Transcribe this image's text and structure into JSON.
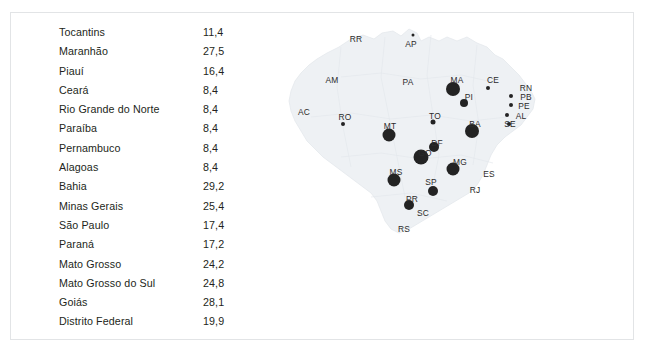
{
  "table": {
    "rows": [
      {
        "label": "Tocantins",
        "value": "11,4"
      },
      {
        "label": "Maranhão",
        "value": "27,5"
      },
      {
        "label": "Piauí",
        "value": "16,4"
      },
      {
        "label": "Ceará",
        "value": "8,4"
      },
      {
        "label": "Rio Grande do Norte",
        "value": "8,4"
      },
      {
        "label": "Paraíba",
        "value": "8,4"
      },
      {
        "label": "Pernambuco",
        "value": "8,4"
      },
      {
        "label": "Alagoas",
        "value": "8,4"
      },
      {
        "label": "Bahia",
        "value": "29,2"
      },
      {
        "label": "Minas Gerais",
        "value": "25,4"
      },
      {
        "label": "São Paulo",
        "value": "17,4"
      },
      {
        "label": "Paraná",
        "value": "17,2"
      },
      {
        "label": "Mato Grosso",
        "value": "24,2"
      },
      {
        "label": "Mato Grosso do Sul",
        "value": "24,8"
      },
      {
        "label": "Goiás",
        "value": "28,1"
      },
      {
        "label": "Distrito Federal",
        "value": "19,9"
      }
    ]
  },
  "map": {
    "labels": [
      {
        "text": "RR",
        "x": 75,
        "y": 22
      },
      {
        "text": "AP",
        "x": 130,
        "y": 27
      },
      {
        "text": "AM",
        "x": 51,
        "y": 63
      },
      {
        "text": "PA",
        "x": 127,
        "y": 65
      },
      {
        "text": "AC",
        "x": 23,
        "y": 95
      },
      {
        "text": "RO",
        "x": 64,
        "y": 100
      },
      {
        "text": "TO",
        "x": 154,
        "y": 99
      },
      {
        "text": "MA",
        "x": 176,
        "y": 63
      },
      {
        "text": "PI",
        "x": 188,
        "y": 80
      },
      {
        "text": "CE",
        "x": 212,
        "y": 63
      },
      {
        "text": "RN",
        "x": 245,
        "y": 71
      },
      {
        "text": "PB",
        "x": 245,
        "y": 80
      },
      {
        "text": "PE",
        "x": 243,
        "y": 89
      },
      {
        "text": "AL",
        "x": 240,
        "y": 99
      },
      {
        "text": "SE",
        "x": 229,
        "y": 107
      },
      {
        "text": "BA",
        "x": 194,
        "y": 107
      },
      {
        "text": "MT",
        "x": 109,
        "y": 109
      },
      {
        "text": "DF",
        "x": 156,
        "y": 126
      },
      {
        "text": "GO",
        "x": 144,
        "y": 136
      },
      {
        "text": "MG",
        "x": 179,
        "y": 145
      },
      {
        "text": "ES",
        "x": 208,
        "y": 157
      },
      {
        "text": "RJ",
        "x": 194,
        "y": 173
      },
      {
        "text": "MS",
        "x": 115,
        "y": 155
      },
      {
        "text": "SP",
        "x": 150,
        "y": 165
      },
      {
        "text": "PR",
        "x": 131,
        "y": 182
      },
      {
        "text": "SC",
        "x": 142,
        "y": 196
      },
      {
        "text": "RS",
        "x": 123,
        "y": 212
      }
    ],
    "bubbles": [
      {
        "state": "AP",
        "x": 132,
        "y": 18,
        "size": 3
      },
      {
        "state": "MA",
        "x": 172,
        "y": 72,
        "size": 14
      },
      {
        "state": "PI",
        "x": 183,
        "y": 86,
        "size": 8
      },
      {
        "state": "CE",
        "x": 207,
        "y": 71,
        "size": 4
      },
      {
        "state": "RN",
        "x": 230,
        "y": 79,
        "size": 4
      },
      {
        "state": "PB",
        "x": 230,
        "y": 88,
        "size": 4
      },
      {
        "state": "PE",
        "x": 226,
        "y": 98,
        "size": 4
      },
      {
        "state": "AL",
        "x": 228,
        "y": 107,
        "size": 4
      },
      {
        "state": "RO",
        "x": 62,
        "y": 107,
        "size": 4
      },
      {
        "state": "TO",
        "x": 152,
        "y": 105,
        "size": 5
      },
      {
        "state": "BA",
        "x": 191,
        "y": 114,
        "size": 14
      },
      {
        "state": "MT",
        "x": 108,
        "y": 118,
        "size": 13
      },
      {
        "state": "DF",
        "x": 153,
        "y": 130,
        "size": 10
      },
      {
        "state": "GO",
        "x": 140,
        "y": 140,
        "size": 15
      },
      {
        "state": "MG",
        "x": 172,
        "y": 152,
        "size": 13
      },
      {
        "state": "MS",
        "x": 113,
        "y": 163,
        "size": 13
      },
      {
        "state": "SP",
        "x": 152,
        "y": 174,
        "size": 10
      },
      {
        "state": "PR",
        "x": 128,
        "y": 188,
        "size": 10
      }
    ],
    "colors": {
      "bubble": "#232323",
      "land": "#eef1f4",
      "border": "#e2e6ea"
    }
  },
  "caption": {
    "text": ""
  }
}
